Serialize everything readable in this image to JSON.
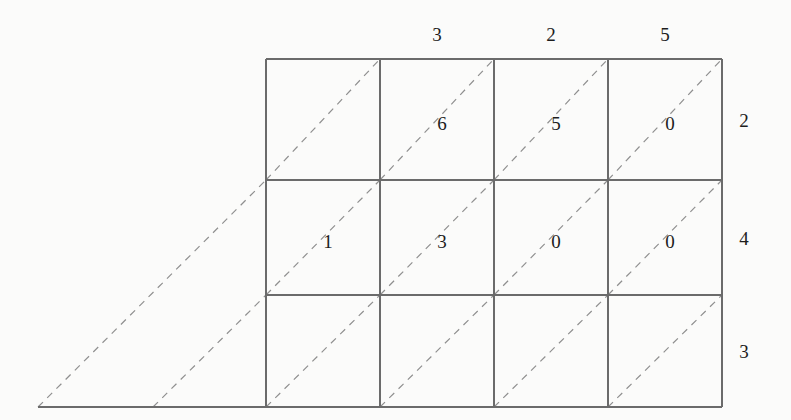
{
  "figure": {
    "kind": "lattice-grid-with-diagonals",
    "background_color": "#fbfbfa",
    "solid_line_color": "#6b6b6b",
    "dashed_line_color": "#8f8f8f",
    "text_color": "#1d1d1d"
  },
  "grid": {
    "columns": 4,
    "rows": 3,
    "left": 266,
    "top": 59,
    "right": 722,
    "bottom": 407,
    "x_lines": [
      266,
      380,
      494,
      608,
      722
    ],
    "y_lines": [
      59,
      180,
      295,
      407
    ],
    "baseline": {
      "y": 407,
      "x_start": 38,
      "x_end": 722
    }
  },
  "labels": {
    "top": [
      {
        "column": 1,
        "text": ""
      },
      {
        "column": 2,
        "text": "3"
      },
      {
        "column": 3,
        "text": "2"
      },
      {
        "column": 4,
        "text": "5"
      }
    ],
    "right": [
      {
        "row": 1,
        "text": "2"
      },
      {
        "row": 2,
        "text": "4"
      },
      {
        "row": 3,
        "text": "3"
      }
    ]
  },
  "cells": [
    [
      {
        "row": 1,
        "column": 1,
        "text": ""
      },
      {
        "row": 1,
        "column": 2,
        "text": "6"
      },
      {
        "row": 1,
        "column": 3,
        "text": "5"
      },
      {
        "row": 1,
        "column": 4,
        "text": "0"
      }
    ],
    [
      {
        "row": 2,
        "column": 1,
        "text": "1"
      },
      {
        "row": 2,
        "column": 2,
        "text": "3"
      },
      {
        "row": 2,
        "column": 3,
        "text": "0"
      },
      {
        "row": 2,
        "column": 4,
        "text": "0"
      }
    ],
    [
      {
        "row": 3,
        "column": 1,
        "text": ""
      },
      {
        "row": 3,
        "column": 2,
        "text": ""
      },
      {
        "row": 3,
        "column": 3,
        "text": ""
      },
      {
        "row": 3,
        "column": 4,
        "text": ""
      }
    ]
  ],
  "extended_diagonals": [
    {
      "from_x": 38,
      "from_y": 407,
      "to_x": 266,
      "to_y": 180
    },
    {
      "from_x": 153,
      "from_y": 407,
      "to_x": 266,
      "to_y": 295
    }
  ]
}
